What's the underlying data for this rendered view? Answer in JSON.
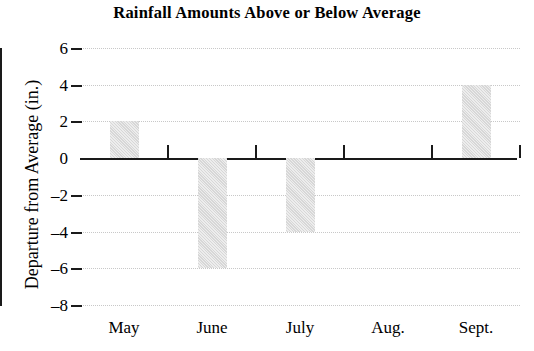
{
  "chart_data": {
    "type": "bar",
    "title": "Rainfall Amounts Above or Below Average",
    "xlabel": "",
    "ylabel": "Departure from Average (in.)",
    "categories": [
      "May",
      "June",
      "July",
      "Aug.",
      "Sept."
    ],
    "values": [
      2,
      -6,
      -4,
      0,
      4
    ],
    "ylim": [
      -8,
      6
    ],
    "yticks": [
      6,
      4,
      2,
      0,
      -2,
      -4,
      -6,
      -8
    ],
    "ytick_labels": [
      "6",
      "4",
      "2",
      "0",
      "–2",
      "–4",
      "–6",
      "–8"
    ],
    "grid": true,
    "legend": false,
    "bar_color": "#d7d7d7",
    "axis_color": "#1a1a1a",
    "gridline_color": "#c8c8c8"
  }
}
